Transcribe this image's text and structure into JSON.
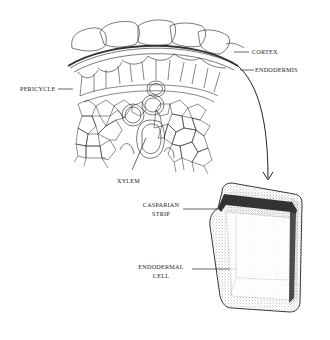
{
  "diagram": {
    "type": "botanical-illustration",
    "labels": {
      "cortex": "CORTEX",
      "endodermis": "ENDODERMIS",
      "pericycle": "PERICYCLE",
      "xylem": "XYLEM",
      "casparian_strip_line1": "CASPARIAN",
      "casparian_strip_line2": "STRIP",
      "endodermal_cell_line1": "ENDODERMAL",
      "endodermal_cell_line2": "CELL"
    },
    "colors": {
      "ink": "#222222",
      "strip": "#333333",
      "background": "#ffffff",
      "stipple": "#555555"
    }
  }
}
